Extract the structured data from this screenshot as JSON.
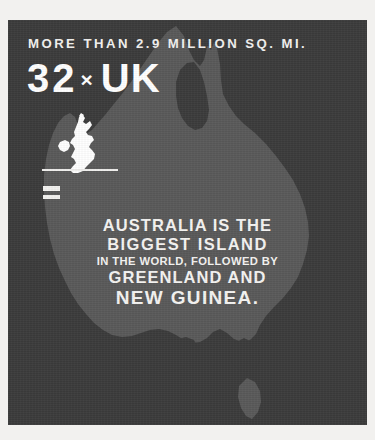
{
  "theme": {
    "page_background": "#f2f1ef",
    "panel_background": "#3b3b3b",
    "map_fill": "#595959",
    "text_color": "#f5f4f2"
  },
  "header": {
    "headline": "MORE THAN 2.9 MILLION SQ. MI."
  },
  "comparison": {
    "multiplier": "32",
    "times_symbol": "×",
    "unit_label": "UK",
    "unit_map_icon": "united-kingdom-map-icon",
    "equals_symbol": "=",
    "divider": ""
  },
  "statement": {
    "line1": "AUSTRALIA IS THE",
    "line2": "BIGGEST ISLAND",
    "line3": "IN THE WORLD, FOLLOWED BY",
    "line4": "GREENLAND AND",
    "line5": "NEW GUINEA."
  },
  "background_map": {
    "icon": "australia-map-icon",
    "label": "Australia"
  }
}
